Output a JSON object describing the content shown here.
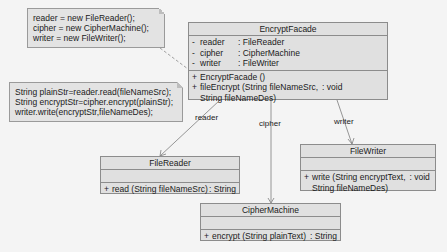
{
  "notes": [
    {
      "lines": [
        "reader = new FileReader();",
        "cipher = new CipherMachine();",
        "writer = new FileWriter();"
      ]
    },
    {
      "lines": [
        "String plainStr=reader.read(fileNameSrc);",
        "String encryptStr=cipher.encrypt(plainStr);",
        "writer.write(encryptStr,fileNameDes);"
      ]
    }
  ],
  "classes": {
    "encrypt_facade": {
      "name": "EncryptFacade",
      "attributes": [
        {
          "vis": "-",
          "name": "reader",
          "type": ": FileReader"
        },
        {
          "vis": "-",
          "name": "cipher",
          "type": ": CipherMachine"
        },
        {
          "vis": "-",
          "name": "writer",
          "type": ": FileWriter"
        }
      ],
      "operations": [
        {
          "vis": "+",
          "sig": "EncryptFacade ()",
          "ret": ""
        },
        {
          "vis": "+",
          "sig": "fileEncrypt (String fileNameSrc,",
          "ret": ": void",
          "cont": "String fileNameDes)"
        }
      ]
    },
    "file_reader": {
      "name": "FileReader",
      "operations": [
        {
          "vis": "+",
          "sig": "read (String fileNameSrc)",
          "ret": ": String"
        }
      ]
    },
    "file_writer": {
      "name": "FileWriter",
      "operations": [
        {
          "vis": "+",
          "sig": "write (String encryptText,",
          "ret": ": void",
          "cont": "String fileNameDes)"
        }
      ]
    },
    "cipher_machine": {
      "name": "CipherMachine",
      "operations": [
        {
          "vis": "+",
          "sig": "encrypt (String plainText)",
          "ret": ": String"
        }
      ]
    }
  },
  "associations": {
    "reader": "reader",
    "cipher": "cipher",
    "writer": "writer"
  }
}
